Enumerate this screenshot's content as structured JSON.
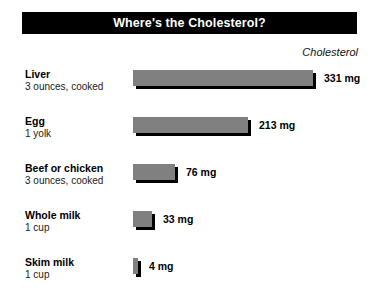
{
  "title": "Where's the Cholesterol?",
  "column_header": "Cholesterol",
  "colors": {
    "banner_background": "#000000",
    "banner_text": "#ffffff",
    "bar_fill": "#808080",
    "bar_shadow": "#000000",
    "page_background": "#ffffff",
    "text": "#000000"
  },
  "chart_data": {
    "type": "bar",
    "orientation": "horizontal",
    "title": "Where's the Cholesterol?",
    "xlabel": "",
    "ylabel": "",
    "unit": "mg",
    "value_axis_label": "Cholesterol",
    "grid": false,
    "legend": false,
    "xlim": [
      0,
      331
    ],
    "categories": [
      "Liver",
      "Egg",
      "Beef or chicken",
      "Whole milk",
      "Skim milk"
    ],
    "values": [
      331,
      213,
      76,
      33,
      4
    ],
    "value_labels": [
      "331 mg",
      "213 mg",
      "76 mg",
      "33 mg",
      "4 mg"
    ],
    "servings": [
      "3 ounces, cooked",
      "1 yolk",
      "3 ounces, cooked",
      "1 cup",
      "1 cup"
    ],
    "rows": [
      {
        "name": "Liver",
        "serving": "3 ounces, cooked",
        "value": 331,
        "value_label": "331 mg",
        "bar_width_px": 180
      },
      {
        "name": "Egg",
        "serving": "1 yolk",
        "value": 213,
        "value_label": "213 mg",
        "bar_width_px": 115
      },
      {
        "name": "Beef or chicken",
        "serving": "3 ounces, cooked",
        "value": 76,
        "value_label": "76 mg",
        "bar_width_px": 42
      },
      {
        "name": "Whole milk",
        "serving": "1 cup",
        "value": 33,
        "value_label": "33 mg",
        "bar_width_px": 19
      },
      {
        "name": "Skim milk",
        "serving": "1 cup",
        "value": 4,
        "value_label": "4 mg",
        "bar_width_px": 5
      }
    ]
  }
}
